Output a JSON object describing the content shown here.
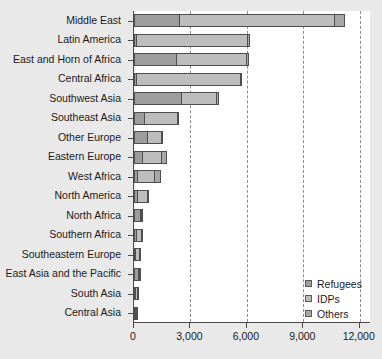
{
  "chart_data": {
    "type": "bar",
    "orientation": "horizontal",
    "stacked": true,
    "title": "",
    "xlabel": "",
    "ylabel": "",
    "xlim": [
      0,
      12600
    ],
    "xticks": [
      0,
      3000,
      6000,
      9000,
      12000
    ],
    "xticklabels": [
      "0",
      "3,000",
      "6,000",
      "9,000",
      "12,000"
    ],
    "grid": "x-dashed",
    "legend_position": "lower right",
    "categories": [
      "Middle East",
      "Latin America",
      "East and Horn of Africa",
      "Central Africa",
      "Southwest Asia",
      "Southeast Asia",
      "Other Europe",
      "Eastern Europe",
      "West Africa",
      "North America",
      "North Africa",
      "Southern Africa",
      "Southeastern Europe",
      "East Asia and the Pacific",
      "South Asia",
      "Central Asia"
    ],
    "series": [
      {
        "name": "Refugees",
        "color": "#9d9d9d",
        "values": [
          2450,
          180,
          2300,
          180,
          2550,
          570,
          750,
          500,
          230,
          230,
          370,
          160,
          130,
          260,
          70,
          30
        ]
      },
      {
        "name": "IDPs",
        "color": "#bdbdbd",
        "values": [
          8300,
          5950,
          3750,
          5550,
          1900,
          1800,
          800,
          1050,
          950,
          560,
          130,
          330,
          240,
          60,
          180,
          20
        ]
      },
      {
        "name": "Others",
        "color": "#a8a8a8",
        "values": [
          600,
          160,
          170,
          110,
          200,
          110,
          60,
          320,
          340,
          110,
          60,
          60,
          60,
          60,
          60,
          10
        ]
      }
    ],
    "totals": [
      11350,
      6290,
      6220,
      5840,
      4650,
      2480,
      1610,
      1870,
      1520,
      900,
      560,
      550,
      430,
      380,
      310,
      60
    ]
  },
  "legend": {
    "items": [
      {
        "label": "Refugees"
      },
      {
        "label": "IDPs"
      },
      {
        "label": "Others"
      }
    ]
  }
}
